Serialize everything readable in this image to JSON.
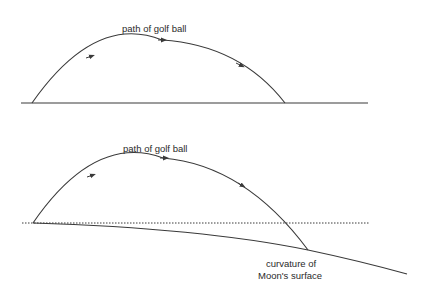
{
  "diagram": {
    "top": {
      "label": "path of golf ball",
      "description": "flat surface"
    },
    "bottom": {
      "label": "path of golf ball",
      "surface_label_line1": "curvature of",
      "surface_label_line2": "Moon's surface"
    }
  },
  "colors": {
    "line": "#3a3a3a",
    "text": "#2a2a2a",
    "background": "#ffffff"
  }
}
